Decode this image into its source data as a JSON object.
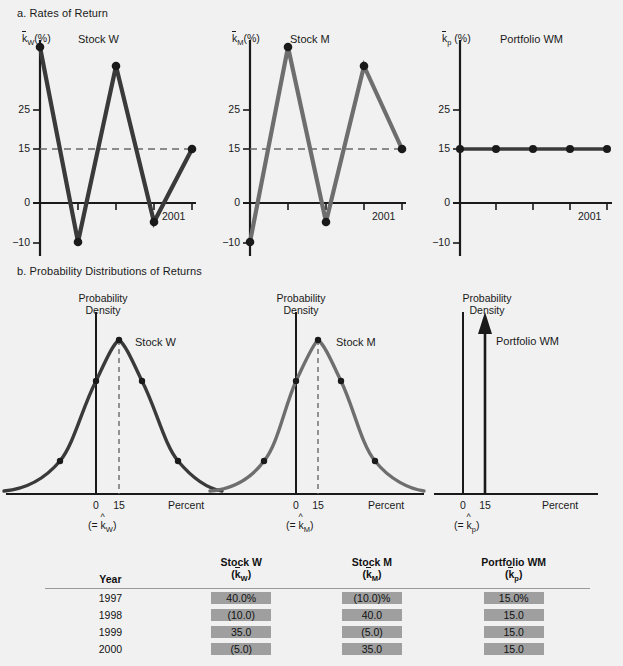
{
  "headings": {
    "a": "a. Rates of Return",
    "b": "b. Probability Distributions of Returns"
  },
  "rates_panels": [
    {
      "id": "stock-w",
      "title": "Stock W",
      "y_axis_label_k": "k",
      "y_axis_label_sub": "W",
      "y_axis_label_unit": "(%)",
      "end_year": "2001",
      "ticks": [
        "25",
        "15",
        "0",
        "−10"
      ]
    },
    {
      "id": "stock-m",
      "title": "Stock M",
      "y_axis_label_k": "k",
      "y_axis_label_sub": "M",
      "y_axis_label_unit": "(%)",
      "end_year": "2001",
      "ticks": [
        "25",
        "15",
        "0",
        "−10"
      ]
    },
    {
      "id": "portfolio-wm",
      "title": "Portfolio WM",
      "y_axis_label_k": "k",
      "y_axis_label_sub": "p",
      "y_axis_label_unit": "(%)",
      "end_year": "2001",
      "ticks": [
        "25",
        "15",
        "0",
        "−10"
      ]
    }
  ],
  "dist_panels": [
    {
      "id": "dist-stock-w",
      "axis_title_line1": "Probability",
      "axis_title_line2": "Density",
      "series_title": "Stock W",
      "tick_zero": "0",
      "tick_mean": "15",
      "x_axis_label": "Percent",
      "mean_note_prefix": "(= ",
      "mean_note_k": "k",
      "mean_note_sub": "W",
      "mean_note_suffix": ")"
    },
    {
      "id": "dist-stock-m",
      "axis_title_line1": "Probability",
      "axis_title_line2": "Density",
      "series_title": "Stock M",
      "tick_zero": "0",
      "tick_mean": "15",
      "x_axis_label": "Percent",
      "mean_note_prefix": "(= ",
      "mean_note_k": "k",
      "mean_note_sub": "M",
      "mean_note_suffix": ")"
    },
    {
      "id": "dist-portfolio-wm",
      "axis_title_line1": "Probability",
      "axis_title_line2": "Density",
      "series_title": "Portfolio WM",
      "tick_zero": "0",
      "tick_mean": "15",
      "x_axis_label": "Percent",
      "mean_note_prefix": "(= ",
      "mean_note_k": "k",
      "mean_note_sub": "p",
      "mean_note_suffix": ")"
    }
  ],
  "table": {
    "headers": {
      "year": "Year",
      "stock_w_line1": "Stock W",
      "stock_w_k": "k",
      "stock_w_sub": "W",
      "stock_m_line1": "Stock M",
      "stock_m_k": "k",
      "stock_m_sub": "M",
      "portfolio_line1": "Portfolio WM",
      "portfolio_k": "k",
      "portfolio_sub": "p"
    },
    "rows": [
      {
        "year": "1997",
        "stock_w": "40.0%",
        "stock_m": "(10.0)%",
        "portfolio": "15.0%"
      },
      {
        "year": "1998",
        "stock_w": "(10.0)",
        "stock_m": "40.0",
        "portfolio": "15.0"
      },
      {
        "year": "1999",
        "stock_w": "35.0",
        "stock_m": "(5.0)",
        "portfolio": "15.0"
      },
      {
        "year": "2000",
        "stock_w": "(5.0)",
        "stock_m": "35.0",
        "portfolio": "15.0"
      }
    ]
  },
  "colors": {
    "background": "#f1f1f1",
    "stock_w_line": "#3a3a3a",
    "stock_m_line": "#6e6e6e",
    "portfolio_line": "#3a3a3a",
    "axis": "#1a1a1a",
    "dashed_guide": "#6a6a6a",
    "table_highlight": "#9f9f9f"
  },
  "chart_data": [
    {
      "type": "line",
      "title": "Stock W",
      "xlabel": "Year",
      "ylabel": "k̄W (%)",
      "x": [
        "1997",
        "1998",
        "1999",
        "2000",
        "2001"
      ],
      "values": [
        40.0,
        -10.0,
        35.0,
        -5.0,
        15.0
      ],
      "ylim": [
        -14,
        44
      ],
      "yticks": [
        25,
        15,
        0,
        -10
      ],
      "reference_line": 15,
      "grid": false,
      "legend": "none"
    },
    {
      "type": "line",
      "title": "Stock M",
      "xlabel": "Year",
      "ylabel": "k̄M (%)",
      "x": [
        "1997",
        "1998",
        "1999",
        "2000",
        "2001"
      ],
      "values": [
        -10.0,
        40.0,
        -5.0,
        35.0,
        15.0
      ],
      "ylim": [
        -14,
        44
      ],
      "yticks": [
        25,
        15,
        0,
        -10
      ],
      "reference_line": 15,
      "grid": false,
      "legend": "none"
    },
    {
      "type": "line",
      "title": "Portfolio WM",
      "xlabel": "Year",
      "ylabel": "k̄p (%)",
      "x": [
        "1997",
        "1998",
        "1999",
        "2000",
        "2001"
      ],
      "values": [
        15.0,
        15.0,
        15.0,
        15.0,
        15.0
      ],
      "ylim": [
        -14,
        44
      ],
      "yticks": [
        25,
        15,
        0,
        -10
      ],
      "grid": false,
      "legend": "none"
    },
    {
      "type": "line",
      "title": "Stock W probability distribution",
      "xlabel": "Percent",
      "ylabel": "Probability Density",
      "distribution": "normal",
      "mean": 15,
      "std": 65.84,
      "annotation": "(= k̂W)",
      "xticks": [
        0,
        15
      ],
      "grid": false,
      "legend": "none"
    },
    {
      "type": "line",
      "title": "Stock M probability distribution",
      "xlabel": "Percent",
      "ylabel": "Probability Density",
      "distribution": "normal",
      "mean": 15,
      "std": 65.84,
      "annotation": "(= k̂M)",
      "xticks": [
        0,
        15
      ],
      "grid": false,
      "legend": "none"
    },
    {
      "type": "line",
      "title": "Portfolio WM probability distribution",
      "xlabel": "Percent",
      "ylabel": "Probability Density",
      "distribution": "point-mass-spike",
      "mean": 15,
      "std": 0,
      "annotation": "(= k̂p)",
      "xticks": [
        0,
        15
      ],
      "grid": false,
      "legend": "none"
    },
    {
      "type": "table",
      "title": "Annual returns",
      "columns": [
        "Year",
        "Stock W (k̄W)",
        "Stock M (k̄M)",
        "Portfolio WM (k̄p)"
      ],
      "rows": [
        [
          "1997",
          "40.0%",
          "(10.0)%",
          "15.0%"
        ],
        [
          "1998",
          "(10.0)",
          "40.0",
          "15.0"
        ],
        [
          "1999",
          "35.0",
          "(5.0)",
          "15.0"
        ],
        [
          "2000",
          "(5.0)",
          "35.0",
          "15.0"
        ]
      ]
    }
  ]
}
